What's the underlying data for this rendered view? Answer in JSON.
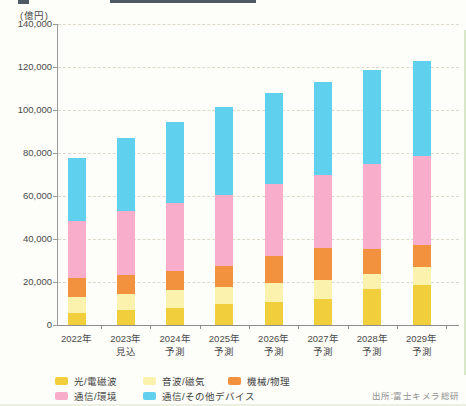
{
  "chart_data": {
    "type": "bar",
    "stacked": true,
    "title": "",
    "unit_label": "(億円)",
    "categories": [
      "2022年",
      "2023年",
      "2024年",
      "2025年",
      "2026年",
      "2027年",
      "2028年",
      "2029年"
    ],
    "category_sublabels": [
      "",
      "見込",
      "予測",
      "予測",
      "予測",
      "予測",
      "予測",
      "予測"
    ],
    "series": [
      {
        "name": "光/電磁波",
        "color": "#f1ce3b",
        "values": [
          5500,
          6800,
          7800,
          9900,
          10600,
          12300,
          16700,
          18700
        ]
      },
      {
        "name": "音波/磁気",
        "color": "#fbf3ad",
        "values": [
          7500,
          7700,
          8300,
          7700,
          9000,
          8500,
          7000,
          8200
        ]
      },
      {
        "name": "機械/物理",
        "color": "#f2923f",
        "values": [
          9000,
          9000,
          8900,
          9800,
          12300,
          14900,
          11800,
          10400
        ]
      },
      {
        "name": "通信/環境",
        "color": "#f8aecb",
        "values": [
          26300,
          29400,
          31700,
          32900,
          33800,
          34300,
          39200,
          41100
        ]
      },
      {
        "name": "通信/その他デバイス",
        "color": "#5fd0ee",
        "values": [
          29200,
          34100,
          37800,
          41200,
          42300,
          43000,
          43800,
          44600
        ]
      }
    ],
    "totals": [
      77500,
      87000,
      94500,
      101500,
      108000,
      113000,
      118500,
      123000
    ],
    "ylim": [
      0,
      140000
    ],
    "ytick_step": 20000,
    "ytick_labels": [
      "140,000",
      "120,000",
      "100,000",
      "80,000",
      "60,000",
      "40,000",
      "20,000",
      "0"
    ],
    "grid": "horizontal-dashed",
    "legend_position": "bottom",
    "legend_rows": [
      [
        0,
        1,
        2
      ],
      [
        3,
        4
      ]
    ]
  },
  "source": "出所:富士キメラ総研"
}
